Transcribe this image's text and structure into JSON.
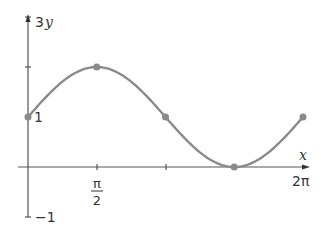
{
  "chart_data": {
    "type": "line",
    "title": "",
    "function": "y = 1 + sin(x)",
    "xlabel": "x",
    "ylabel": "y",
    "xlim": [
      0,
      6.2832
    ],
    "ylim": [
      -1,
      3
    ],
    "x_ticks": [
      {
        "value": 1.5708,
        "label_num": "π",
        "label_den": "2"
      },
      {
        "value": 3.1416,
        "label": ""
      },
      {
        "value": 4.7124,
        "label": ""
      },
      {
        "value": 6.2832,
        "label": "2π"
      }
    ],
    "y_ticks": [
      {
        "value": 1,
        "label": "1"
      },
      {
        "value": 2,
        "label": ""
      },
      {
        "value": 3,
        "label": "3"
      },
      {
        "value": -1,
        "label": "−1"
      }
    ],
    "points": [
      {
        "x": 0,
        "y": 1
      },
      {
        "x": 1.5708,
        "y": 2
      },
      {
        "x": 3.1416,
        "y": 1
      },
      {
        "x": 4.7124,
        "y": 0
      },
      {
        "x": 6.2832,
        "y": 1
      }
    ],
    "grid": false,
    "line_color": "#8a8a8a",
    "point_color": "#8a8a8a",
    "axis_color": "#444444"
  },
  "labels": {
    "x_axis": "x",
    "y_axis": "y",
    "y_top": "3",
    "y_one": "1",
    "y_bottom": "−1",
    "x_pi_num": "π",
    "x_pi_den": "2",
    "x_2pi": "2π"
  }
}
